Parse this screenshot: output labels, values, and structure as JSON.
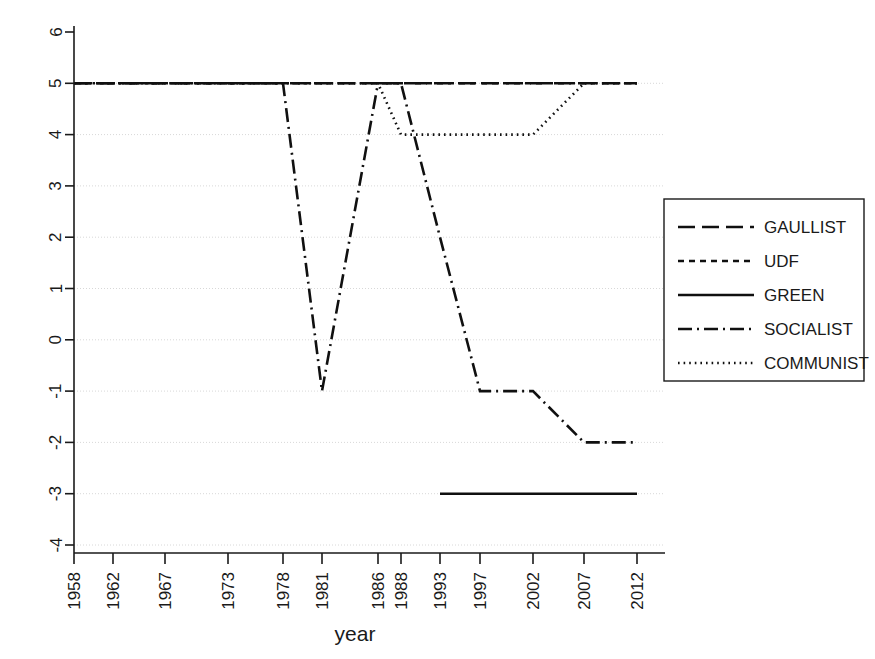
{
  "chart_data": {
    "type": "line",
    "title": "",
    "xlabel": "year",
    "ylabel": "",
    "grid": true,
    "legend_position": "right",
    "categories": [
      "1958",
      "1962",
      "1967",
      "1973",
      "1978",
      "1981",
      "1986",
      "1988",
      "1993",
      "1997",
      "2002",
      "2007",
      "2012"
    ],
    "x_tick_labels": [
      "1958",
      "1962",
      "1967",
      "1973",
      "1978",
      "1981",
      "1986",
      "1988",
      "1993",
      "1997",
      "2002",
      "2007",
      "2012"
    ],
    "y_tick_labels": [
      "6",
      "5",
      "4",
      "3",
      "2",
      "1",
      "0",
      "-1",
      "-2",
      "-3",
      "-4"
    ],
    "ylim": [
      -4,
      6
    ],
    "yticks": [
      -4,
      -3,
      -2,
      -1,
      0,
      1,
      2,
      3,
      4,
      5,
      6
    ],
    "series": [
      {
        "name": "GAULLIST",
        "dash": "long-dash",
        "x": [
          "1958",
          "1962",
          "1967",
          "1973",
          "1978",
          "1981",
          "1986",
          "1988",
          "1993",
          "1997",
          "2002",
          "2007",
          "2012"
        ],
        "values": [
          5,
          5,
          5,
          5,
          5,
          5,
          5,
          5,
          5,
          5,
          5,
          5,
          5
        ]
      },
      {
        "name": "UDF",
        "dash": "short-dash",
        "x": [
          "1958",
          "1962",
          "1967",
          "1973",
          "1978",
          "1981",
          "1986",
          "1988",
          "1993",
          "1997",
          "2002",
          "2007",
          "2012"
        ],
        "values": [
          5,
          5,
          5,
          5,
          5,
          5,
          5,
          5,
          5,
          5,
          5,
          5,
          5
        ]
      },
      {
        "name": "GREEN",
        "dash": "solid",
        "x": [
          "1993",
          "1997",
          "2002",
          "2007",
          "2012"
        ],
        "values": [
          -3,
          -3,
          -3,
          -3,
          -3
        ]
      },
      {
        "name": "SOCIALIST",
        "dash": "dash-dot",
        "x": [
          "1958",
          "1962",
          "1967",
          "1973",
          "1978",
          "1981",
          "1986",
          "1988",
          "1993",
          "1997",
          "2002",
          "2007",
          "2012"
        ],
        "values": [
          5,
          5,
          5,
          5,
          5,
          -1,
          5,
          5,
          2,
          -1,
          -1,
          -2,
          -2
        ]
      },
      {
        "name": "COMMUNIST",
        "dash": "dotted",
        "x": [
          "1958",
          "1962",
          "1967",
          "1973",
          "1978",
          "1981",
          "1986",
          "1988",
          "1993",
          "1997",
          "2002",
          "2007",
          "2012"
        ],
        "values": [
          5,
          5,
          5,
          5,
          5,
          5,
          5,
          4,
          4,
          4,
          4,
          5,
          5
        ]
      }
    ],
    "legend_entries": [
      {
        "label": "GAULLIST",
        "dash": "long-dash"
      },
      {
        "label": "UDF",
        "dash": "short-dash"
      },
      {
        "label": "GREEN",
        "dash": "solid"
      },
      {
        "label": "SOCIALIST",
        "dash": "dash-dot"
      },
      {
        "label": "COMMUNIST",
        "dash": "dotted"
      }
    ],
    "colors": {
      "line": "#101010",
      "grid": "#d8d8d8",
      "axis": "#1a1a1a",
      "background": "#ffffff"
    }
  }
}
